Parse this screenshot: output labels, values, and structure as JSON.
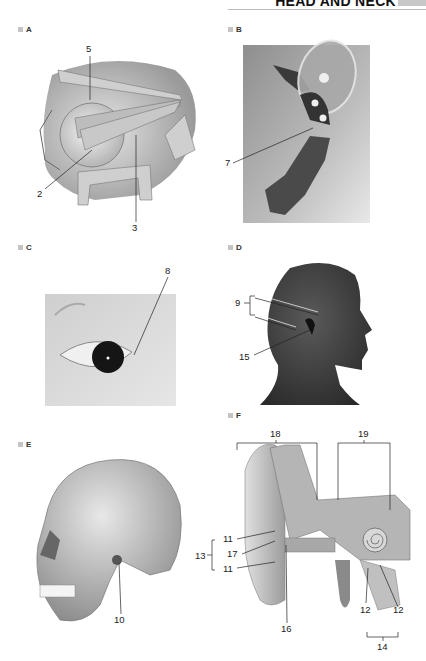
{
  "header": {
    "title": "HEAD AND NECK"
  },
  "panels": [
    {
      "id": "A",
      "label": "A",
      "subject": "orbit sagittal section with eyeball and extraocular muscles",
      "callouts": [
        "5",
        "2",
        "3"
      ]
    },
    {
      "id": "B",
      "label": "B",
      "subject": "cross-section illustration (ear ossicle/cartilage)",
      "callouts": [
        "7"
      ]
    },
    {
      "id": "C",
      "label": "C",
      "subject": "photograph of eye",
      "callouts": [
        "8"
      ]
    },
    {
      "id": "D",
      "label": "D",
      "subject": "lateral profile of head",
      "callouts": [
        "9",
        "15"
      ]
    },
    {
      "id": "E",
      "label": "E",
      "subject": "lateral view of skull",
      "callouts": [
        "10"
      ]
    },
    {
      "id": "F",
      "label": "F",
      "subject": "coronal section of ear",
      "callouts": [
        "18",
        "19",
        "11",
        "17",
        "13",
        "11",
        "16",
        "12",
        "12",
        "14"
      ]
    }
  ],
  "labels": {
    "a5": "5",
    "a2": "2",
    "a3": "3",
    "b7": "7",
    "c8": "8",
    "d9": "9",
    "d15": "15",
    "e10": "10",
    "f18": "18",
    "f19": "19",
    "f11a": "11",
    "f17": "17",
    "f13": "13",
    "f11b": "11",
    "f16": "16",
    "f12a": "12",
    "f12b": "12",
    "f14": "14"
  },
  "colors": {
    "label_square": "#c4c4c4",
    "header_bar": "#c8c8c8"
  }
}
